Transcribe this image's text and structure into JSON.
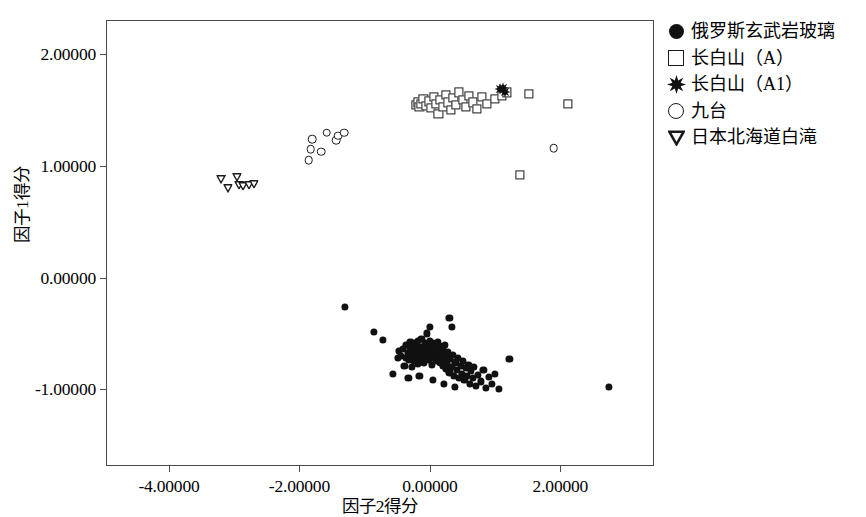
{
  "chart": {
    "type": "scatter",
    "title": "",
    "xlabel": "因子2得分",
    "ylabel": "因子1得分",
    "xlim": [
      -4.95,
      3.42
    ],
    "ylim": [
      -1.68,
      2.3
    ],
    "xticks": [
      -4.0,
      -2.0,
      0.0,
      2.0
    ],
    "xticklabels": [
      "-4.00000",
      "-2.00000",
      "0.00000",
      "2.00000"
    ],
    "yticks": [
      2.0,
      1.0,
      0.0,
      -1.0
    ],
    "yticklabels": [
      "2.00000",
      "1.00000",
      "0.00000",
      "-1.00000"
    ],
    "grid": false,
    "legend_position": "right"
  },
  "legend": {
    "items": [
      {
        "label": "俄罗斯玄武岩玻璃",
        "marker": "filled-circle",
        "marker_name": "filled-circle-marker"
      },
      {
        "label": "长白山（A）",
        "marker": "open-square",
        "marker_name": "open-square-marker"
      },
      {
        "label": "长白山（A1）",
        "marker": "star",
        "marker_name": "star-marker"
      },
      {
        "label": "九台",
        "marker": "open-circle",
        "marker_name": "open-circle-marker"
      },
      {
        "label": "日本北海道白滝",
        "marker": "open-triangle-down",
        "marker_name": "open-triangle-down-marker"
      }
    ]
  },
  "chart_data": {
    "type": "scatter",
    "title": "",
    "xlabel": "因子2得分",
    "ylabel": "因子1得分",
    "xlim": [
      -4.95,
      3.42
    ],
    "ylim": [
      -1.68,
      2.3
    ],
    "xticks": [
      -4.0,
      -2.0,
      0.0,
      2.0
    ],
    "yticks": [
      2.0,
      1.0,
      0.0,
      -1.0
    ],
    "grid": false,
    "legend_position": "right",
    "series": [
      {
        "name": "俄罗斯玄武岩玻璃",
        "marker": "filled-circle",
        "points": [
          [
            -1.3,
            -0.26
          ],
          [
            -0.86,
            -0.49
          ],
          [
            -0.72,
            -0.56
          ],
          [
            -0.49,
            -0.72
          ],
          [
            -0.47,
            -0.66
          ],
          [
            -0.44,
            -0.7
          ],
          [
            -0.41,
            -0.64
          ],
          [
            -0.39,
            -0.79
          ],
          [
            -0.37,
            -0.72
          ],
          [
            -0.36,
            -0.6
          ],
          [
            -0.34,
            -0.68
          ],
          [
            -0.32,
            -0.74
          ],
          [
            -0.31,
            -0.63
          ],
          [
            -0.3,
            -0.58
          ],
          [
            -0.29,
            -0.71
          ],
          [
            -0.28,
            -0.8
          ],
          [
            -0.27,
            -0.66
          ],
          [
            -0.26,
            -0.61
          ],
          [
            -0.25,
            -0.75
          ],
          [
            -0.24,
            -0.69
          ],
          [
            -0.23,
            -0.59
          ],
          [
            -0.22,
            -0.73
          ],
          [
            -0.21,
            -0.64
          ],
          [
            -0.2,
            -0.68
          ],
          [
            -0.19,
            -0.57
          ],
          [
            -0.18,
            -0.77
          ],
          [
            -0.17,
            -0.66
          ],
          [
            -0.16,
            -0.71
          ],
          [
            -0.15,
            -0.62
          ],
          [
            -0.14,
            -0.74
          ],
          [
            -0.13,
            -0.55
          ],
          [
            -0.12,
            -0.67
          ],
          [
            -0.11,
            -0.7
          ],
          [
            -0.1,
            -0.63
          ],
          [
            -0.09,
            -0.76
          ],
          [
            -0.08,
            -0.59
          ],
          [
            -0.07,
            -0.69
          ],
          [
            -0.06,
            -0.72
          ],
          [
            -0.05,
            -0.5
          ],
          [
            -0.04,
            -0.65
          ],
          [
            -0.03,
            -0.61
          ],
          [
            -0.02,
            -0.74
          ],
          [
            -0.01,
            -0.67
          ],
          [
            0.0,
            -0.44
          ],
          [
            0.0,
            -0.57
          ],
          [
            0.01,
            -0.7
          ],
          [
            0.02,
            -0.63
          ],
          [
            0.03,
            -0.78
          ],
          [
            0.04,
            -0.66
          ],
          [
            0.05,
            -0.59
          ],
          [
            0.06,
            -0.72
          ],
          [
            0.07,
            -0.68
          ],
          [
            0.08,
            -0.62
          ],
          [
            0.09,
            -0.75
          ],
          [
            0.1,
            -0.65
          ],
          [
            0.11,
            -0.7
          ],
          [
            0.12,
            -0.58
          ],
          [
            0.13,
            -0.73
          ],
          [
            0.14,
            -0.67
          ],
          [
            0.15,
            -0.61
          ],
          [
            0.16,
            -0.76
          ],
          [
            0.17,
            -0.69
          ],
          [
            0.18,
            -0.64
          ],
          [
            0.19,
            -0.71
          ],
          [
            0.2,
            -0.79
          ],
          [
            0.21,
            -0.66
          ],
          [
            0.22,
            -0.74
          ],
          [
            0.23,
            -0.6
          ],
          [
            0.24,
            -0.82
          ],
          [
            0.25,
            -0.7
          ],
          [
            0.26,
            -0.77
          ],
          [
            0.28,
            -0.67
          ],
          [
            0.3,
            -0.85
          ],
          [
            0.31,
            -0.73
          ],
          [
            0.33,
            -0.8
          ],
          [
            0.35,
            -0.69
          ],
          [
            0.37,
            -0.88
          ],
          [
            0.39,
            -0.76
          ],
          [
            0.41,
            -0.83
          ],
          [
            0.43,
            -0.72
          ],
          [
            0.45,
            -0.9
          ],
          [
            0.47,
            -0.79
          ],
          [
            0.49,
            -0.86
          ],
          [
            0.51,
            -0.75
          ],
          [
            0.53,
            -0.92
          ],
          [
            0.55,
            -0.81
          ],
          [
            0.57,
            -0.88
          ],
          [
            0.59,
            -0.78
          ],
          [
            0.61,
            -0.95
          ],
          [
            0.63,
            -0.84
          ],
          [
            0.66,
            -0.9
          ],
          [
            0.68,
            -0.8
          ],
          [
            0.71,
            -0.97
          ],
          [
            0.74,
            -0.87
          ],
          [
            0.78,
            -0.93
          ],
          [
            0.82,
            -0.83
          ],
          [
            0.86,
            -0.99
          ],
          [
            0.9,
            -0.89
          ],
          [
            0.95,
            -0.95
          ],
          [
            1.0,
            -0.86
          ],
          [
            1.06,
            -1.0
          ],
          [
            -0.57,
            -0.86
          ],
          [
            -0.33,
            -0.9
          ],
          [
            -0.16,
            -0.88
          ],
          [
            0.05,
            -0.92
          ],
          [
            0.22,
            -0.95
          ],
          [
            0.38,
            -0.98
          ],
          [
            0.3,
            -0.36
          ],
          [
            0.34,
            -0.44
          ],
          [
            1.22,
            -0.73
          ],
          [
            2.75,
            -0.98
          ]
        ]
      },
      {
        "name": "长白山（A）",
        "marker": "open-square",
        "points": [
          [
            -0.22,
            1.55
          ],
          [
            -0.19,
            1.57
          ],
          [
            -0.16,
            1.53
          ],
          [
            -0.13,
            1.56
          ],
          [
            -0.1,
            1.6
          ],
          [
            -0.06,
            1.54
          ],
          [
            -0.02,
            1.58
          ],
          [
            0.02,
            1.52
          ],
          [
            0.06,
            1.62
          ],
          [
            0.1,
            1.56
          ],
          [
            0.13,
            1.47
          ],
          [
            0.16,
            1.59
          ],
          [
            0.2,
            1.53
          ],
          [
            0.24,
            1.64
          ],
          [
            0.28,
            1.57
          ],
          [
            0.32,
            1.5
          ],
          [
            0.36,
            1.61
          ],
          [
            0.4,
            1.55
          ],
          [
            0.45,
            1.66
          ],
          [
            0.5,
            1.59
          ],
          [
            0.55,
            1.53
          ],
          [
            0.6,
            1.63
          ],
          [
            0.66,
            1.57
          ],
          [
            0.72,
            1.51
          ],
          [
            0.8,
            1.62
          ],
          [
            0.88,
            1.56
          ],
          [
            1.0,
            1.6
          ],
          [
            1.1,
            1.63
          ],
          [
            1.18,
            1.66
          ],
          [
            1.52,
            1.65
          ],
          [
            2.12,
            1.56
          ],
          [
            1.38,
            0.92
          ]
        ]
      },
      {
        "name": "长白山（A1）",
        "marker": "star",
        "points": [
          [
            1.07,
            1.69
          ],
          [
            1.12,
            1.7
          ],
          [
            1.15,
            1.66
          ]
        ]
      },
      {
        "name": "九台",
        "marker": "open-circle",
        "points": [
          [
            -1.83,
            1.15
          ],
          [
            -1.8,
            1.24
          ],
          [
            -1.67,
            1.13
          ],
          [
            -1.58,
            1.3
          ],
          [
            -1.44,
            1.23
          ],
          [
            -1.41,
            1.27
          ],
          [
            -1.31,
            1.3
          ],
          [
            -1.86,
            1.05
          ],
          [
            1.9,
            1.16
          ]
        ]
      },
      {
        "name": "日本北海道白滝",
        "marker": "open-triangle-down",
        "points": [
          [
            -3.2,
            0.88
          ],
          [
            -3.1,
            0.8
          ],
          [
            -2.96,
            0.9
          ],
          [
            -2.92,
            0.83
          ],
          [
            -2.86,
            0.82
          ],
          [
            -2.78,
            0.83
          ],
          [
            -2.7,
            0.84
          ]
        ]
      }
    ]
  }
}
